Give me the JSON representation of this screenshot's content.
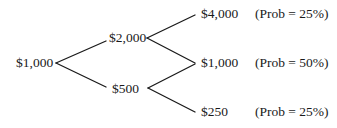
{
  "diagram": {
    "type": "binomial-tree",
    "line_color": "#1a1a1a",
    "root": {
      "label": "$1,000"
    },
    "level1": [
      {
        "label": "$2,000"
      },
      {
        "label": "$500"
      }
    ],
    "level2": [
      {
        "label": "$4,000",
        "prob": "(Prob = 25%)"
      },
      {
        "label": "$1,000",
        "prob": "(Prob = 50%)"
      },
      {
        "label": "$250",
        "prob": "(Prob = 25%)"
      }
    ]
  }
}
